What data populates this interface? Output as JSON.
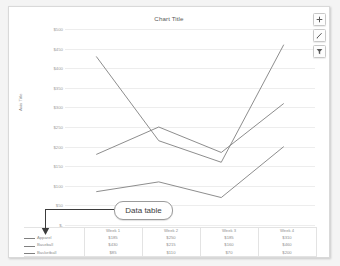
{
  "chart_data": {
    "type": "line",
    "title": "Chart Title",
    "xlabel": "",
    "ylabel": "Axis Title",
    "categories": [
      "Week 1",
      "Week 2",
      "Week 3",
      "Week 4"
    ],
    "series": [
      {
        "name": "Apparel",
        "values": [
          180,
          250,
          185,
          310
        ],
        "labels": [
          "$185",
          "$250",
          "$185",
          "$310"
        ]
      },
      {
        "name": "Baseball",
        "values": [
          430,
          215,
          160,
          460
        ],
        "labels": [
          "$430",
          "$215",
          "$160",
          "$460"
        ]
      },
      {
        "name": "Basketball",
        "values": [
          85,
          110,
          70,
          200
        ],
        "labels": [
          "$85",
          "$110",
          "$70",
          "$200"
        ]
      }
    ],
    "ylim": [
      0,
      500
    ],
    "ytick_step": 50,
    "ytick_labels": [
      "$500",
      "$450",
      "$400",
      "$350",
      "$300",
      "$250",
      "$200",
      "$150",
      "$100",
      "$50",
      "$-"
    ],
    "grid": true,
    "legend_position": "data-table",
    "line_color": "#808080",
    "grid_color": "#ededed"
  },
  "data_table": {
    "headers": [
      "Week 1",
      "Week 2",
      "Week 3",
      "Week 4"
    ],
    "rows": [
      {
        "category": "Apparel",
        "cells": [
          "$185",
          "$250",
          "$185",
          "$310"
        ]
      },
      {
        "category": "Baseball",
        "cells": [
          "$430",
          "$215",
          "$160",
          "$460"
        ]
      },
      {
        "category": "Basketball",
        "cells": [
          "$85",
          "$110",
          "$70",
          "$200"
        ]
      }
    ]
  },
  "callout": {
    "label": "Data table"
  },
  "chart_buttons": [
    {
      "name": "chart-elements",
      "icon": "plus-icon"
    },
    {
      "name": "chart-styles",
      "icon": "brush-icon"
    },
    {
      "name": "chart-filters",
      "icon": "filter-icon"
    }
  ]
}
